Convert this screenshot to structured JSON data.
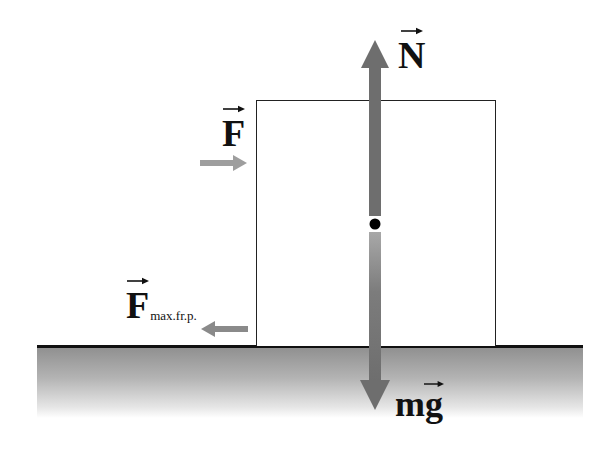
{
  "diagram": {
    "colors": {
      "arrow_dark": "#6e6e6e",
      "arrow_light": "#9e9e9e",
      "outline": "#222222",
      "ground_top": "#8e8e8e",
      "ground_bottom": "#ffffff",
      "center_dot": "#000000"
    },
    "forces": [
      {
        "id": "normal",
        "label": "N",
        "direction": "up",
        "vector": true
      },
      {
        "id": "applied",
        "label": "F",
        "direction": "right",
        "vector": true
      },
      {
        "id": "max_friction",
        "label": "F",
        "subscript": "max.fr.p.",
        "direction": "left",
        "vector": true
      },
      {
        "id": "gravity",
        "label": "mg",
        "direction": "down",
        "vector": true
      }
    ],
    "labels": {
      "normal": "N",
      "applied": "F",
      "friction_main": "F",
      "friction_sub": "max.fr.p.",
      "gravity": "mg"
    },
    "objects": {
      "block": "rectangular block",
      "surface": "ground",
      "center_of_mass": "point"
    }
  }
}
